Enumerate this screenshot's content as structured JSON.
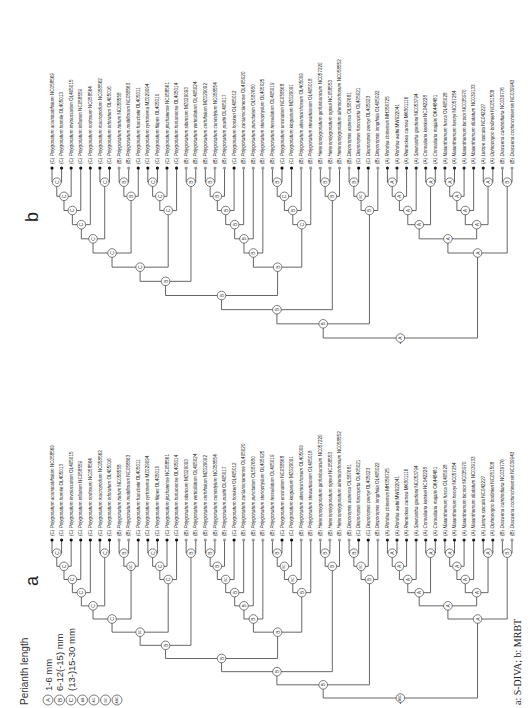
{
  "figure": {
    "caption": "a: S-DIVA;  b: MRBT",
    "legend": {
      "title": "Perianth length",
      "items": [
        {
          "state": "A",
          "label": "1-6 mm"
        },
        {
          "state": "B",
          "label": "6-12(-15) mm"
        },
        {
          "state": "C",
          "label": "(13-)15-30 mm"
        },
        {
          "state": "AB",
          "label": ""
        },
        {
          "state": "AC",
          "label": ""
        },
        {
          "state": "BC",
          "label": ""
        },
        {
          "state": "ABC",
          "label": ""
        }
      ]
    },
    "tip_colors": {
      "A": "#222222",
      "B": "#9a9a9a",
      "C": "#111111"
    },
    "taxa": [
      {
        "state": "C",
        "genus": "Polygonatum",
        "epithet": "acuminatifolium",
        "acc": "NC058569"
      },
      {
        "state": "C",
        "genus": "Polygonatum",
        "epithet": "humile",
        "acc": "OL405013"
      },
      {
        "state": "C",
        "genus": "Polygonatum",
        "epithet": "involucratum",
        "acc": "OL405015"
      },
      {
        "state": "C",
        "genus": "Polygonatum",
        "epithet": "inflatum",
        "acc": "NC058559"
      },
      {
        "state": "C",
        "genus": "Polygonatum",
        "epithet": "nodosum",
        "acc": "NC058564"
      },
      {
        "state": "C",
        "genus": "Polygonatum",
        "epithet": "macropodum",
        "acc": "NC058562"
      },
      {
        "state": "C",
        "genus": "Polygonatum",
        "epithet": "odoratum",
        "acc": "OL405016"
      },
      {
        "state": "B",
        "genus": "Polygonatum",
        "epithet": "hirtum",
        "acc": "NC058558"
      },
      {
        "state": "B",
        "genus": "Polygonatum",
        "epithet": "multiflorum",
        "acc": "NC058563"
      },
      {
        "state": "C",
        "genus": "Polygonatum",
        "epithet": "franchetii",
        "acc": "OL405011"
      },
      {
        "state": "C",
        "genus": "Polygonatum",
        "epithet": "cyrtonema",
        "acc": "MZ029094"
      },
      {
        "state": "C",
        "genus": "Polygonatum",
        "epithet": "filipes",
        "acc": "OL405010"
      },
      {
        "state": "C",
        "genus": "Polygonatum",
        "epithet": "jinzhaiense",
        "acc": "NC058561"
      },
      {
        "state": "C",
        "genus": "Polygonatum",
        "epithet": "hunanense",
        "acc": "OL405014"
      },
      {
        "state": "B",
        "genus": "Polygonatum",
        "epithet": "sibiricum",
        "acc": "MZ029093"
      },
      {
        "state": "B",
        "genus": "Polygonatum",
        "epithet": "verticillatum",
        "acc": "OL405024"
      },
      {
        "state": "B",
        "genus": "Polygonatum",
        "epithet": "cirrhifolium",
        "acc": "MZ029092"
      },
      {
        "state": "B",
        "genus": "Polygonatum",
        "epithet": "curvistylum",
        "acc": "NC058554"
      },
      {
        "state": "B",
        "genus": "Polygonatum",
        "epithet": "prattii",
        "acc": "OL405017"
      },
      {
        "state": "C",
        "genus": "Polygonatum",
        "epithet": "hookeri",
        "acc": "OL405012"
      },
      {
        "state": "B",
        "genus": "Polygonatum",
        "epithet": "zanlanscianense",
        "acc": "OL405020"
      },
      {
        "state": "B",
        "genus": "Polygonatum",
        "epithet": "punctatum",
        "acc": "OL587680"
      },
      {
        "state": "B",
        "genus": "Polygonatum",
        "epithet": "stenophyllum",
        "acc": "OL405025"
      },
      {
        "state": "B",
        "genus": "Polygonatum",
        "epithet": "tessellatum",
        "acc": "OL405019"
      },
      {
        "state": "C",
        "genus": "Polygonatum",
        "epithet": "uncinatum",
        "acc": "NC058568"
      },
      {
        "state": "C",
        "genus": "Polygonatum",
        "epithet": "kingianum",
        "acc": "MZ029091"
      },
      {
        "state": "B",
        "genus": "Polygonatum",
        "epithet": "alternicirrhosum",
        "acc": "OL405009"
      },
      {
        "state": "B",
        "genus": "Polygonatum",
        "epithet": "stewartianum",
        "acc": "OL405018"
      },
      {
        "state": "B",
        "genus": "Heteropolygonatum",
        "epithet": "ginfushanicum",
        "acc": "NC057220"
      },
      {
        "state": "B",
        "genus": "Heteropolygonatum",
        "epithet": "ogisui",
        "acc": "NC058553"
      },
      {
        "state": "B",
        "genus": "Heteropolygonatum",
        "epithet": "alternicirrhosum",
        "acc": "NC058552"
      },
      {
        "state": "B",
        "genus": "Disporopsis",
        "epithet": "aspersa",
        "acc": "OL587681"
      },
      {
        "state": "C",
        "genus": "Disporopsis",
        "epithet": "fuscopicta",
        "acc": "OL405021"
      },
      {
        "state": "C",
        "genus": "Disporopsis",
        "epithet": "pernyi",
        "acc": "OL405023"
      },
      {
        "state": "B",
        "genus": "Disporopsis",
        "epithet": "longifolia",
        "acc": "OL405022"
      },
      {
        "state": "A",
        "genus": "Rohdea",
        "epithet": "chinensis",
        "acc": "MH356725"
      },
      {
        "state": "A",
        "genus": "Rohdea",
        "epithet": "wattii",
        "acc": "MW922041"
      },
      {
        "state": "A",
        "genus": "Reineckea",
        "epithet": "carnea",
        "acc": "MK801116"
      },
      {
        "state": "A",
        "genus": "Speirantha",
        "epithet": "gardenii",
        "acc": "NC053794"
      },
      {
        "state": "A",
        "genus": "Convallaria",
        "epithet": "keiskei",
        "acc": "NC042228"
      },
      {
        "state": "A",
        "genus": "Convallaria",
        "epithet": "majalis",
        "acc": "OK448481"
      },
      {
        "state": "A",
        "genus": "Maianthemum",
        "epithet": "fusca",
        "acc": "OL405028"
      },
      {
        "state": "A",
        "genus": "Maianthemum",
        "epithet": "henryi",
        "acc": "NC057254"
      },
      {
        "state": "A",
        "genus": "Maianthemum",
        "epithet": "bicolor",
        "acc": "NC035970"
      },
      {
        "state": "A",
        "genus": "Maianthemum",
        "epithet": "dilatatum",
        "acc": "NC039133"
      },
      {
        "state": "A",
        "genus": "Liriope",
        "epithet": "spicata",
        "acc": "NC042227"
      },
      {
        "state": "A",
        "genus": "Ophiopogon",
        "epithet": "bodinieri",
        "acc": "NC051508"
      },
      {
        "state": "B",
        "genus": "Dracaena",
        "epithet": "cambodiana",
        "acc": "NC039776"
      },
      {
        "state": "B",
        "genus": "Dracaena",
        "epithet": "cochinchinensis",
        "acc": "NC039943"
      }
    ],
    "panels": [
      {
        "id": "b",
        "letter": "b",
        "method": "MRBT",
        "tree": [
          "A",
          [
            "B",
            [
              "B",
              [
                "B",
                [
                  "C",
                  [
                    "C",
                    [
                      "C",
                      [
                        "C",
                        [
                          "C",
                          [
                            "C",
                            [
                              "C",
                              0,
                              1
                            ],
                            2
                          ],
                          3
                        ],
                        4
                      ],
                      [
                        "C",
                        5,
                        6
                      ]
                    ],
                    [
                      "B",
                      [
                        "B",
                        7,
                        8
                      ],
                      9
                    ]
                  ],
                  [
                    "C",
                    [
                      "C",
                      [
                        "C",
                        10,
                        11
                      ],
                      12
                    ],
                    13
                  ]
                ],
                [
                  "B",
                  14,
                  15
                ]
              ],
              [
                "B",
                [
                  "B",
                  [
                    "B",
                    [
                      "B",
                      [
                        "B",
                        [
                          "B",
                          [
                            "B",
                            16,
                            17
                          ],
                          18
                        ],
                        19
                      ],
                      20
                    ],
                    21
                  ],
                  22
                ],
                [
                  "C",
                  [
                    "B",
                    [
                      "C",
                      [
                        "B",
                        23,
                        24
                      ],
                      25
                    ],
                    26
                  ],
                  [
                    "B",
                    27,
                    28
                  ]
                ]
              ]
            ],
            [
              "B",
              [
                "B",
                29,
                30
              ],
              31
            ]
          ],
          [
            "A",
            [
              "A",
              [
                "A",
                [
                  "A",
                  [
                    "A",
                    [
                      "A",
                      35,
                      36
                    ],
                    37
                  ],
                  38
                ],
                [
                  "A",
                  39,
                  40
                ]
              ],
              [
                "A",
                [
                  "A",
                  [
                    "A",
                    [
                      "A",
                      41,
                      42
                    ],
                    43
                  ],
                  44
                ],
                [
                  "A",
                  45,
                  46
                ]
              ]
            ],
            [
              "B",
              47,
              48
            ]
          ]
        ],
        "disporopsis_clade": [
          "B",
          [
            "B",
            [
              "C",
              [
                "B",
                31,
                32
              ],
              33
            ],
            34
          ]
        ]
      },
      {
        "id": "a",
        "letter": "a",
        "method": "S-DIVA",
        "tree": [
          "ABC",
          [
            "B",
            [
              "B",
              [
                "B",
                [
                  "BC",
                  [
                    "C",
                    [
                      "C",
                      [
                        "C",
                        [
                          "C",
                          [
                            "C",
                            [
                              "C",
                              0,
                              1
                            ],
                            2
                          ],
                          3
                        ],
                        4
                      ],
                      [
                        "C",
                        5,
                        6
                      ]
                    ],
                    [
                      "BC",
                      [
                        "B",
                        7,
                        8
                      ],
                      9
                    ]
                  ],
                  [
                    "C",
                    [
                      "C",
                      [
                        "C",
                        10,
                        11
                      ],
                      12
                    ],
                    13
                  ]
                ],
                [
                  "B",
                  14,
                  15
                ]
              ],
              [
                "B",
                [
                  "B",
                  [
                    "B",
                    [
                      "B",
                      [
                        "BC",
                        [
                          "B",
                          [
                            "B",
                            16,
                            17
                          ],
                          18
                        ],
                        19
                      ],
                      20
                    ],
                    21
                  ],
                  22
                ],
                [
                  "B",
                  [
                    "BC",
                    [
                      "BC",
                      [
                        "B",
                        23,
                        24
                      ],
                      25
                    ],
                    26
                  ],
                  [
                    "B",
                    27,
                    28
                  ]
                ]
              ]
            ],
            [
              "B",
              [
                "B",
                29,
                30
              ],
              31
            ]
          ],
          [
            "A",
            [
              "A",
              [
                "A",
                [
                  "A",
                  [
                    "A",
                    [
                      "A",
                      35,
                      36
                    ],
                    37
                  ],
                  38
                ],
                [
                  "A",
                  39,
                  40
                ]
              ],
              [
                "A",
                [
                  "A",
                  [
                    "A",
                    [
                      "A",
                      41,
                      42
                    ],
                    43
                  ],
                  44
                ],
                [
                  "A",
                  45,
                  46
                ]
              ]
            ],
            [
              "B",
              47,
              48
            ]
          ]
        ]
      }
    ]
  }
}
